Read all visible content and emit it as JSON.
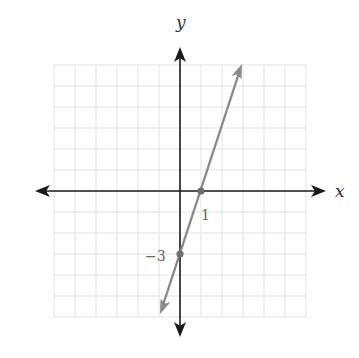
{
  "chart_data": {
    "type": "line",
    "title": "",
    "xlabel": "x",
    "ylabel": "y",
    "xlim": [
      -6,
      6
    ],
    "ylim": [
      -6,
      6
    ],
    "grid": true,
    "equation": "y = 3x - 3",
    "series": [
      {
        "name": "line",
        "x": [
          -0.95,
          2.95
        ],
        "y": [
          -5.85,
          5.85
        ],
        "color": "#8a8a8a",
        "arrows": "both"
      }
    ],
    "points": [
      {
        "x": 1,
        "y": 0,
        "label": "1"
      },
      {
        "x": 0,
        "y": -3,
        "label": "−3"
      }
    ],
    "annotations": [
      "1",
      "−3"
    ]
  },
  "labels": {
    "x_axis": "x",
    "y_axis": "y",
    "x_intercept": "1",
    "y_intercept": "−3"
  },
  "colors": {
    "axis": "#1a1a1a",
    "grid": "#e3e3e3",
    "line": "#8a8a8a",
    "point": "#6f6f6f"
  }
}
